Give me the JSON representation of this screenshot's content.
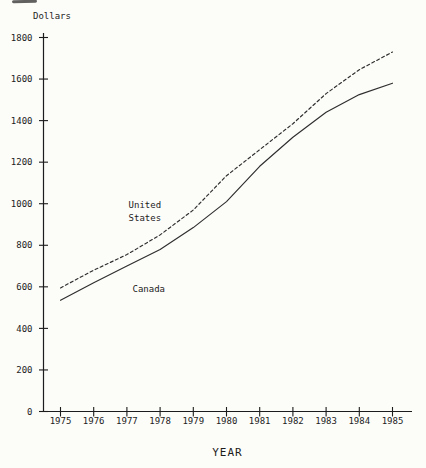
{
  "page": {
    "ink": "#1c1c1c",
    "line_color": "#2e2e2e",
    "background": "#fcfcf9"
  },
  "chart_data": {
    "type": "line",
    "title": "",
    "xlabel": "YEAR",
    "ylabel": "Dollars",
    "x": [
      1975,
      1976,
      1977,
      1978,
      1979,
      1980,
      1981,
      1982,
      1983,
      1984,
      1985
    ],
    "xticks": [
      "1975",
      "1976",
      "1977",
      "1978",
      "1979",
      "1980",
      "1981",
      "1982",
      "1983",
      "1984",
      "1985"
    ],
    "yticks": [
      0,
      200,
      400,
      600,
      800,
      1000,
      1200,
      1400,
      1600,
      1800
    ],
    "ylim": [
      0,
      1800
    ],
    "xlim": [
      1975,
      1985
    ],
    "grid": false,
    "legend_position": "inline-annotations",
    "series": [
      {
        "name": "United States",
        "line_style": "dashed",
        "values": [
          595,
          680,
          755,
          850,
          970,
          1135,
          1260,
          1385,
          1530,
          1645,
          1730
        ]
      },
      {
        "name": "Canada",
        "line_style": "solid",
        "values": [
          535,
          620,
          700,
          780,
          885,
          1010,
          1180,
          1320,
          1440,
          1525,
          1580
        ]
      }
    ],
    "annotations": [
      {
        "series": "United States",
        "lines": [
          "United",
          "States"
        ],
        "x": 1977.05,
        "y": 979
      },
      {
        "series": "Canada",
        "lines": [
          "Canada"
        ],
        "x": 1977.17,
        "y": 576
      }
    ]
  }
}
